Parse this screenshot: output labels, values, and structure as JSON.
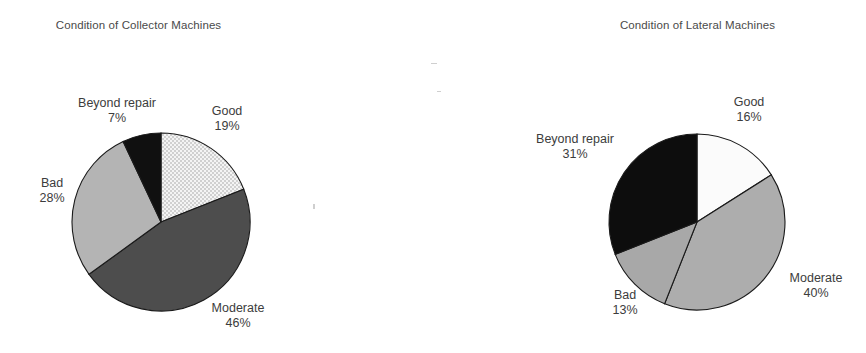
{
  "figure": {
    "background": "#ffffff",
    "text_color": "#3c3c3c"
  },
  "charts": [
    {
      "id": "collector",
      "title": "Condition of Collector Machines",
      "center": {
        "x": 161,
        "y": 222
      },
      "radius": 89,
      "labels": {
        "good_name": "Good",
        "good_pct": "19%",
        "moderate_name": "Moderate",
        "moderate_pct": "46%",
        "bad_name": "Bad",
        "bad_pct": "28%",
        "beyond_name": "Beyond repair",
        "beyond_pct": "7%"
      }
    },
    {
      "id": "lateral",
      "title": "Condition of Lateral Machines",
      "center": {
        "x": 697,
        "y": 222
      },
      "radius": 88,
      "labels": {
        "good_name": "Good",
        "good_pct": "16%",
        "moderate_name": "Moderate",
        "moderate_pct": "40%",
        "bad_name": "Bad",
        "bad_pct": "13%",
        "beyond_name": "Beyond repair",
        "beyond_pct": "31%"
      }
    }
  ],
  "chart_data": [
    {
      "type": "pie",
      "title": "Condition of Collector Machines",
      "categories": [
        "Good",
        "Moderate",
        "Bad",
        "Beyond repair"
      ],
      "values": [
        19,
        46,
        28,
        7
      ],
      "value_labels": [
        "19%",
        "46%",
        "28%",
        "7%"
      ],
      "units": "percent",
      "start_angle_deg": 0,
      "direction": "clockwise",
      "legend": "none",
      "slice_styles": [
        {
          "name": "Good",
          "fill": "#f2f2f2",
          "pattern": "dotted-stipple",
          "stroke": "#1a1a1a"
        },
        {
          "name": "Moderate",
          "fill": "#4d4d4d",
          "pattern": "solid",
          "stroke": "#1a1a1a"
        },
        {
          "name": "Bad",
          "fill": "#b4b4b4",
          "pattern": "solid",
          "stroke": "#1a1a1a"
        },
        {
          "name": "Beyond repair",
          "fill": "#101010",
          "pattern": "solid",
          "stroke": "#1a1a1a"
        }
      ]
    },
    {
      "type": "pie",
      "title": "Condition of Lateral Machines",
      "categories": [
        "Good",
        "Moderate",
        "Bad",
        "Beyond repair"
      ],
      "values": [
        16,
        40,
        13,
        31
      ],
      "value_labels": [
        "16%",
        "40%",
        "13%",
        "31%"
      ],
      "units": "percent",
      "start_angle_deg": 0,
      "direction": "clockwise",
      "legend": "none",
      "slice_styles": [
        {
          "name": "Good",
          "fill": "#fbfbfb",
          "pattern": "solid",
          "stroke": "#1a1a1a"
        },
        {
          "name": "Moderate",
          "fill": "#adadad",
          "pattern": "solid",
          "stroke": "#1a1a1a"
        },
        {
          "name": "Bad",
          "fill": "#a8a8a8",
          "pattern": "solid",
          "stroke": "#1a1a1a"
        },
        {
          "name": "Beyond repair",
          "fill": "#0d0d0d",
          "pattern": "solid",
          "stroke": "#1a1a1a"
        }
      ]
    }
  ]
}
